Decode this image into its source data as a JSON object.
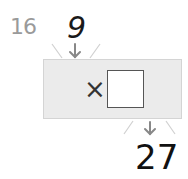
{
  "problem": {
    "number": "16",
    "input_value": "9",
    "operation_symbol": "×",
    "blank_value": "",
    "output_value": "27"
  },
  "colors": {
    "machine_fill": "#ebebeb",
    "machine_border": "#d4d4d4",
    "arrow": "#8a8a8a",
    "number_label": "#9a9a9a"
  }
}
